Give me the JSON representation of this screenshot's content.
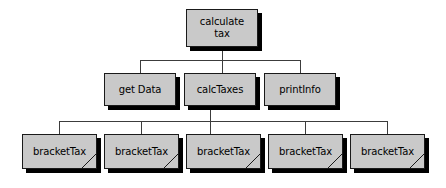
{
  "diagram": {
    "type": "structure-chart",
    "canvas": {
      "width": 446,
      "height": 188,
      "background": "#ffffff"
    },
    "style": {
      "node_fill": "#c9c9c9",
      "node_border": "#1a1a1a",
      "shadow_color": "#000000",
      "connector_color": "#3c3c3c",
      "text_color": "#000000"
    },
    "levels": [
      {
        "name": "root",
        "nodes": [
          {
            "id": "calculate-tax",
            "label": "calculate\ntax",
            "x": 186,
            "y": 9,
            "w": 72,
            "h": 38,
            "library": false
          }
        ]
      },
      {
        "name": "modules",
        "nodes": [
          {
            "id": "get-data",
            "label": "get Data",
            "x": 104,
            "y": 73,
            "w": 72,
            "h": 33,
            "library": false
          },
          {
            "id": "calc-taxes",
            "label": "calcTaxes",
            "x": 184,
            "y": 73,
            "w": 72,
            "h": 33,
            "library": false
          },
          {
            "id": "print-info",
            "label": "printInfo",
            "x": 264,
            "y": 73,
            "w": 72,
            "h": 33,
            "library": false
          }
        ]
      },
      {
        "name": "library-modules",
        "nodes": [
          {
            "id": "bracket-tax-1",
            "label": "bracketTax",
            "x": 22,
            "y": 134,
            "w": 75,
            "h": 35,
            "library": true
          },
          {
            "id": "bracket-tax-2",
            "label": "bracketTax",
            "x": 104,
            "y": 134,
            "w": 75,
            "h": 35,
            "library": true
          },
          {
            "id": "bracket-tax-3",
            "label": "bracketTax",
            "x": 186,
            "y": 134,
            "w": 75,
            "h": 35,
            "library": true
          },
          {
            "id": "bracket-tax-4",
            "label": "bracketTax",
            "x": 268,
            "y": 134,
            "w": 75,
            "h": 35,
            "library": true
          },
          {
            "id": "bracket-tax-5",
            "label": "bracketTax",
            "x": 350,
            "y": 134,
            "w": 75,
            "h": 35,
            "library": true
          }
        ]
      }
    ],
    "connectors": {
      "upper_bus": {
        "y": 60,
        "x_start": 140,
        "x_end": 300,
        "stem_from_x": 222,
        "stem_top_y": 47
      },
      "upper_drops": [
        140,
        222,
        300
      ],
      "upper_drop_bottom_y": 73,
      "lower_bus": {
        "y": 121,
        "x_start": 59,
        "x_end": 387,
        "stem_from_x": 210,
        "stem_top_y": 106
      },
      "lower_drops": [
        59,
        141,
        210,
        305,
        387
      ],
      "lower_drop_bottom_y": 134
    }
  }
}
